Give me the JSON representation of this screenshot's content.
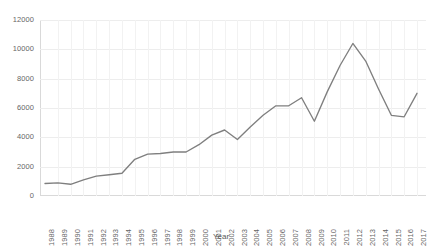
{
  "chart_data": {
    "type": "line",
    "title": "",
    "subtitle": "",
    "xlabel": "Year",
    "ylabel": "",
    "xlim": [
      1988,
      2017
    ],
    "ylim": [
      0,
      12000
    ],
    "grid": true,
    "legend": false,
    "legend_position": "none",
    "line_color": "#7f7f7f",
    "categories": [
      "1988",
      "1989",
      "1990",
      "1991",
      "1992",
      "1993",
      "1994",
      "1995",
      "1996",
      "1997",
      "1998",
      "1999",
      "2000",
      "2001",
      "2002",
      "2003",
      "2004",
      "2005",
      "2006",
      "2007",
      "2008",
      "2009",
      "2010",
      "2011",
      "2012",
      "2013",
      "2014",
      "2015",
      "2016",
      "2017"
    ],
    "x": [
      1988,
      1989,
      1990,
      1991,
      1992,
      1993,
      1994,
      1995,
      1996,
      1997,
      1998,
      1999,
      2000,
      2001,
      2002,
      2003,
      2004,
      2005,
      2006,
      2007,
      2008,
      2009,
      2010,
      2011,
      2012,
      2013,
      2014,
      2015,
      2016,
      2017
    ],
    "values": [
      850,
      900,
      800,
      1100,
      1350,
      1450,
      1550,
      2500,
      2850,
      2900,
      3000,
      3000,
      3500,
      4150,
      4500,
      3850,
      4700,
      5500,
      6150,
      6150,
      6700,
      5100,
      7100,
      8900,
      10400,
      9200,
      7300,
      5500,
      5400,
      7000
    ],
    "yticks": [
      0,
      2000,
      4000,
      6000,
      8000,
      10000,
      12000
    ],
    "ytick_labels": [
      "0",
      "2000",
      "4000",
      "6000",
      "8000",
      "10000",
      "12000"
    ],
    "annotations": []
  }
}
